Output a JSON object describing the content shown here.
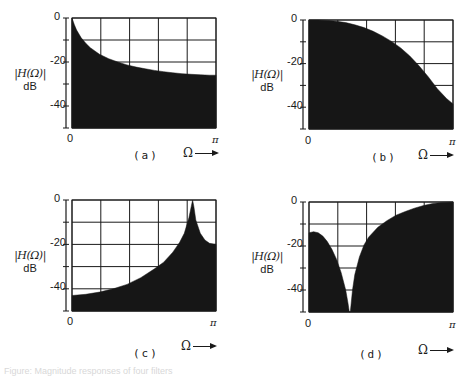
{
  "figure": {
    "y_axis_label_line1": "|H(Ω)|",
    "y_axis_label_line2": "dB",
    "x_axis_label": "Ω",
    "x_tick_start": "0",
    "x_tick_end": "π",
    "y_ticks": [
      "0",
      "-20",
      "-40"
    ],
    "fill_color": "#161616",
    "grid_color": "#1a1a1a",
    "caption": "Figure: Magnitude responses of four filters"
  },
  "panels": [
    {
      "label": "(a)"
    },
    {
      "label": "(b)"
    },
    {
      "label": "(c)"
    },
    {
      "label": "(d)"
    }
  ],
  "chart_data": [
    {
      "type": "area",
      "title": "(a)",
      "xlabel": "Ω",
      "ylabel": "|H(Ω)| dB",
      "x_ticks": [
        "0",
        "π"
      ],
      "y_ticks": [
        0,
        -20,
        -40
      ],
      "xlim": [
        0,
        3.1416
      ],
      "ylim": [
        -50,
        0
      ],
      "grid": true,
      "x": [
        0,
        0.05,
        0.1,
        0.2,
        0.3,
        0.4,
        0.5,
        0.6,
        0.8,
        1.0,
        1.2,
        1.4,
        1.6,
        1.8,
        2.0,
        2.2,
        2.4,
        2.6,
        2.8,
        3.0,
        3.1416
      ],
      "values": [
        0,
        -3,
        -5.5,
        -9,
        -11.5,
        -13.5,
        -15,
        -16.5,
        -18.5,
        -20,
        -21.3,
        -22.3,
        -23.1,
        -23.8,
        -24.4,
        -24.9,
        -25.3,
        -25.6,
        -25.8,
        -26,
        -26
      ]
    },
    {
      "type": "area",
      "title": "(b)",
      "xlabel": "Ω",
      "ylabel": "|H(Ω)| dB",
      "x_ticks": [
        "0",
        "π"
      ],
      "y_ticks": [
        0,
        -20,
        -40
      ],
      "xlim": [
        0,
        3.1416
      ],
      "ylim": [
        -50,
        0
      ],
      "grid": true,
      "x": [
        0,
        0.2,
        0.4,
        0.6,
        0.8,
        1.0,
        1.2,
        1.4,
        1.6,
        1.8,
        2.0,
        2.2,
        2.4,
        2.6,
        2.8,
        3.0,
        3.1416
      ],
      "values": [
        0,
        0,
        -0.2,
        -0.6,
        -1.2,
        -2.2,
        -3.5,
        -5.2,
        -7.3,
        -9.8,
        -12.8,
        -16.5,
        -21,
        -26,
        -31.5,
        -36,
        -38.5
      ]
    },
    {
      "type": "area",
      "title": "(c)",
      "xlabel": "Ω",
      "ylabel": "|H(Ω)| dB",
      "x_ticks": [
        "0",
        "π"
      ],
      "y_ticks": [
        0,
        -20,
        -40
      ],
      "xlim": [
        0,
        3.1416
      ],
      "ylim": [
        -50,
        0
      ],
      "grid": true,
      "x": [
        0,
        0.3,
        0.6,
        0.9,
        1.2,
        1.5,
        1.8,
        2.0,
        2.2,
        2.35,
        2.45,
        2.55,
        2.6,
        2.63,
        2.66,
        2.7,
        2.8,
        2.9,
        3.0,
        3.1416
      ],
      "values": [
        -43,
        -42.5,
        -41.5,
        -40,
        -38,
        -35,
        -31,
        -28,
        -23.5,
        -19,
        -15,
        -8,
        -3,
        0,
        -3,
        -9,
        -15,
        -18,
        -19.5,
        -20
      ]
    },
    {
      "type": "area",
      "title": "(d)",
      "xlabel": "Ω",
      "ylabel": "|H(Ω)| dB",
      "x_ticks": [
        "0",
        "π"
      ],
      "y_ticks": [
        0,
        -20,
        -40
      ],
      "xlim": [
        0,
        3.1416
      ],
      "ylim": [
        -50,
        0
      ],
      "grid": true,
      "x": [
        0,
        0.1,
        0.2,
        0.3,
        0.4,
        0.5,
        0.6,
        0.7,
        0.8,
        0.85,
        0.88,
        0.9,
        0.92,
        0.95,
        1.0,
        1.1,
        1.2,
        1.3,
        1.5,
        1.7,
        1.9,
        2.1,
        2.3,
        2.5,
        2.7,
        2.9,
        3.1416
      ],
      "values": [
        -14,
        -13.5,
        -14,
        -15.5,
        -18,
        -21.5,
        -26,
        -32,
        -40,
        -46,
        -50,
        -50,
        -46,
        -40,
        -33,
        -25,
        -19.5,
        -16,
        -11.5,
        -8.5,
        -6,
        -4.3,
        -2.8,
        -1.6,
        -0.7,
        -0.2,
        0
      ]
    }
  ]
}
